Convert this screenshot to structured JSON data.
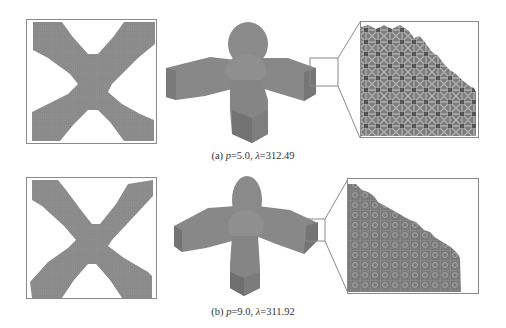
{
  "figure": {
    "rows": [
      {
        "id": "a",
        "caption": {
          "label": "(a)",
          "p_symbol": "p",
          "p_value": "=5.0,",
          "lambda_symbol": "λ",
          "lambda_value": "=312.49"
        },
        "panels": [
          "2d-topology-x-shape",
          "3d-voxel-structure",
          "lattice-zoom-detail"
        ]
      },
      {
        "id": "b",
        "caption": {
          "label": "(b)",
          "p_symbol": "p",
          "p_value": "=9.0,",
          "lambda_symbol": "λ",
          "lambda_value": "=311.92"
        },
        "panels": [
          "2d-topology-x-shape",
          "3d-voxel-structure",
          "lattice-zoom-detail"
        ]
      }
    ],
    "colors": {
      "material": "#8c8c8c",
      "material_dark": "#6e6e6e",
      "lattice_light": "#b4b4b4",
      "frame": "#8a8a8a",
      "background": "#ffffff"
    }
  }
}
